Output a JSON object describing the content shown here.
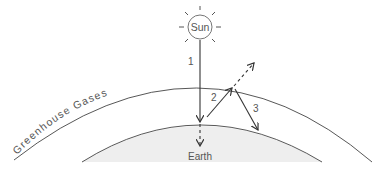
{
  "diagram": {
    "sun": {
      "label": "Sun"
    },
    "earth": {
      "label": "Earth",
      "fill": "#eeeeee"
    },
    "atmosphere": {
      "label": "Greenhouse Gases"
    },
    "arrows": [
      {
        "id": "1",
        "label": "1",
        "description": "Incoming sunlight to Earth"
      },
      {
        "id": "2",
        "label": "2",
        "description": "Radiation emitted from Earth toward atmosphere (partly escapes)"
      },
      {
        "id": "3",
        "label": "3",
        "description": "Radiation re-emitted back to Earth by greenhouse gases"
      }
    ],
    "colors": {
      "line": "#333333",
      "text": "#555555",
      "earth_fill": "#eeeeee"
    }
  }
}
